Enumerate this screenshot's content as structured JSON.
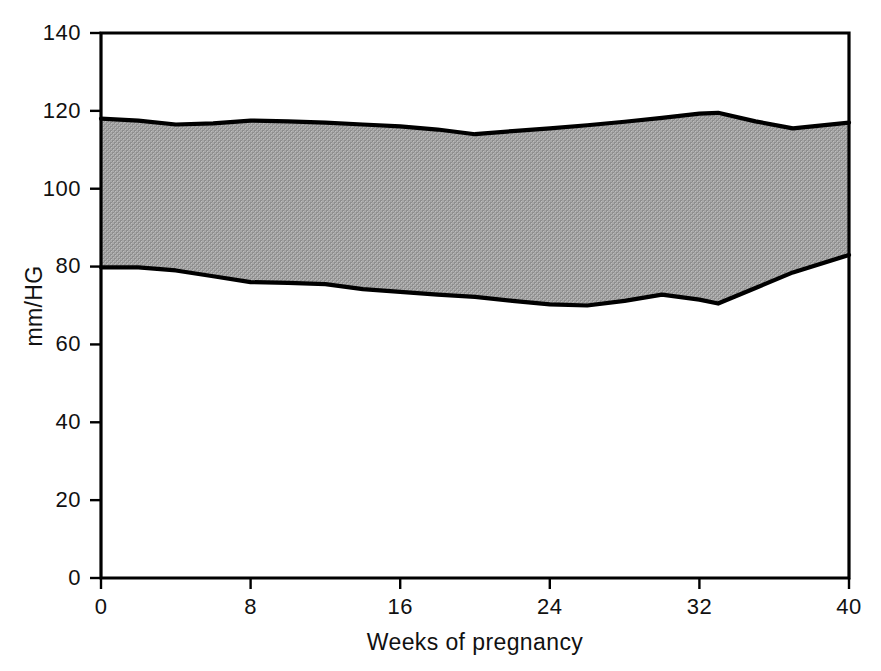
{
  "chart_data": {
    "type": "area",
    "title": "",
    "subtitle": "",
    "xlabel": "Weeks of pregnancy",
    "ylabel": "mm/HG",
    "xlim": [
      0,
      40
    ],
    "ylim": [
      0,
      140
    ],
    "xticks": [
      0,
      8,
      16,
      24,
      32,
      40
    ],
    "yticks": [
      0,
      20,
      40,
      60,
      80,
      100,
      120,
      140
    ],
    "xtick_labels": [
      "0",
      "8",
      "16",
      "24",
      "32",
      "40"
    ],
    "ytick_labels": [
      "0",
      "20",
      "40",
      "60",
      "80",
      "100",
      "120",
      "140"
    ],
    "grid": false,
    "legend": null,
    "legend_position": "none",
    "band_fill_color": "#9a9a9a",
    "line_color": "#000000",
    "background_color": "#ffffff",
    "x": [
      0,
      2,
      4,
      6,
      8,
      10,
      12,
      14,
      16,
      18,
      20,
      22,
      24,
      26,
      28,
      30,
      32,
      33,
      35,
      37,
      40
    ],
    "series": [
      {
        "name": "Systolic (upper band edge)",
        "role": "upper",
        "values": [
          118.0,
          117.5,
          116.5,
          116.8,
          117.5,
          117.3,
          117.0,
          116.5,
          116.0,
          115.2,
          114.0,
          114.8,
          115.5,
          116.3,
          117.2,
          118.2,
          119.3,
          119.5,
          117.3,
          115.5,
          117.0
        ]
      },
      {
        "name": "Diastolic (lower band edge)",
        "role": "lower",
        "values": [
          79.8,
          79.8,
          79.0,
          77.5,
          76.0,
          75.8,
          75.5,
          74.2,
          73.5,
          72.8,
          72.2,
          71.2,
          70.3,
          70.0,
          71.2,
          72.8,
          71.5,
          70.5,
          74.5,
          78.5,
          83.0
        ]
      }
    ]
  },
  "axes": {
    "y_axis_title": "mm/HG",
    "x_axis_title": "Weeks of pregnancy"
  }
}
